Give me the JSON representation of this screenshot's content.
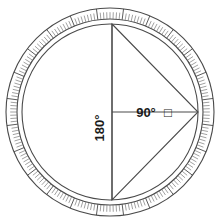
{
  "figure": {
    "background_color": "#ffffff",
    "stroke_color": "#4a4a4a",
    "tick_color": "#6e6e6e",
    "text_color": "#1a1a1a"
  },
  "ring": {
    "name": "graduated-degree-ring",
    "outer_radius": 104,
    "inner_radius": 93,
    "segment_count": 24,
    "segment_span_degrees": 15,
    "minor_ticks_per_segment": 7,
    "center_x": 110,
    "center_y": 112
  },
  "circle": {
    "name": "inner-circle",
    "radius": 88,
    "center_x": 110,
    "center_y": 112
  },
  "triangle": {
    "name": "inscribed-triangle",
    "vertices": [
      {
        "label": "top",
        "x": 112,
        "y": 24
      },
      {
        "label": "right",
        "x": 198,
        "y": 112
      },
      {
        "label": "bottom",
        "x": 112,
        "y": 200
      }
    ]
  },
  "labels": {
    "vertical": {
      "text": "180°",
      "value": 180,
      "unit": "degrees",
      "orientation": "rotated-vertical"
    },
    "horizontal": {
      "text": "90°",
      "value": 90,
      "unit": "degrees",
      "marker": "□",
      "marker_name": "square-glyph"
    }
  },
  "lines": {
    "vertical_diameter": {
      "name": "vertical-diameter",
      "x": 112,
      "y1": 24,
      "y2": 200
    },
    "horizontal_radius": {
      "name": "horizontal-radius",
      "y": 112,
      "x1": 112,
      "x2": 198
    }
  }
}
